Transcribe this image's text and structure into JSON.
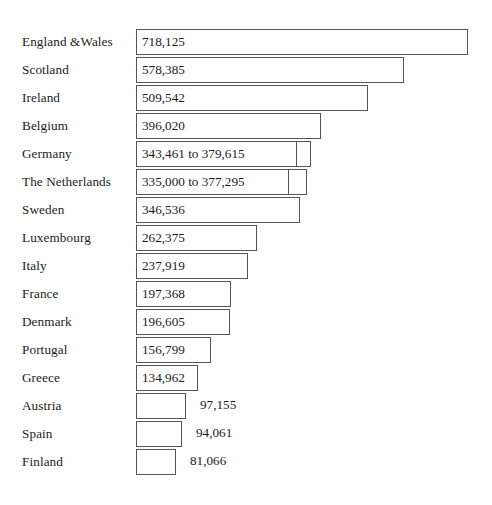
{
  "chart_data": {
    "type": "bar",
    "orientation": "horizontal",
    "title": "",
    "subtitle": "",
    "xlabel": "",
    "ylabel": "",
    "grid": false,
    "legend": null,
    "axis_visible": false,
    "tick_labels": [],
    "xlim": [
      0,
      770000
    ],
    "categories": [
      "England &Wales",
      "Scotland",
      "Ireland",
      "Belgium",
      "Germany",
      "The Netherlands",
      "Sweden",
      "Luxembourg",
      "Italy",
      "France",
      "Denmark",
      "Portugal",
      "Greece",
      "Austria",
      "Spain",
      "Finland"
    ],
    "values": [
      718125,
      578385,
      509542,
      396020,
      379615,
      377295,
      346536,
      262375,
      237919,
      197368,
      196605,
      156799,
      134962,
      97155,
      94061,
      81066
    ],
    "value_labels": [
      "718,125",
      "578,385",
      "509,542",
      "396,020",
      "343,461 to 379,615",
      "335,000 to 377,295",
      "346,536",
      "262,375",
      "237,919",
      "197,368",
      "196,605",
      "156,799",
      "134,962",
      "97,155",
      "94,061",
      "81,066"
    ],
    "ranges": [
      null,
      null,
      null,
      null,
      [
        343461,
        379615
      ],
      [
        335000,
        377295
      ],
      null,
      null,
      null,
      null,
      null,
      null,
      null,
      null,
      null,
      null
    ]
  },
  "style": {
    "bar_fill": "#ffffff",
    "bar_border": "#555555",
    "text_color": "#1b1b1b",
    "background": "#ffffff"
  },
  "geometry": {
    "row_height": 28,
    "first_row_top": 28,
    "bar_left": 136,
    "bar_height": 26,
    "label_inside_threshold_index": 12,
    "rows": [
      {
        "top": 28,
        "width": 332,
        "tick": null,
        "inside": true
      },
      {
        "top": 56,
        "width": 268,
        "tick": null,
        "inside": true
      },
      {
        "top": 84,
        "width": 232,
        "tick": null,
        "inside": true
      },
      {
        "top": 112,
        "width": 185,
        "tick": null,
        "inside": true
      },
      {
        "top": 140,
        "width": 175,
        "tick": 160,
        "inside": true
      },
      {
        "top": 168,
        "width": 171,
        "tick": 152,
        "inside": true
      },
      {
        "top": 196,
        "width": 164,
        "tick": null,
        "inside": true
      },
      {
        "top": 224,
        "width": 121,
        "tick": null,
        "inside": true
      },
      {
        "top": 252,
        "width": 112,
        "tick": null,
        "inside": true
      },
      {
        "top": 280,
        "width": 95,
        "tick": null,
        "inside": true
      },
      {
        "top": 308,
        "width": 94,
        "tick": null,
        "inside": true
      },
      {
        "top": 336,
        "width": 75,
        "tick": null,
        "inside": true
      },
      {
        "top": 364,
        "width": 62,
        "tick": null,
        "inside": true
      },
      {
        "top": 392,
        "width": 50,
        "tick": null,
        "inside": false
      },
      {
        "top": 420,
        "width": 46,
        "tick": null,
        "inside": false
      },
      {
        "top": 448,
        "width": 40,
        "tick": null,
        "inside": false
      }
    ]
  }
}
